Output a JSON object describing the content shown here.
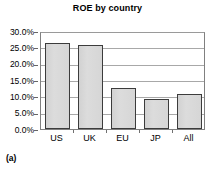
{
  "caption": "(a)",
  "chart_data": {
    "type": "bar",
    "title": "ROE by country",
    "xlabel": "",
    "ylabel": "",
    "categories": [
      "US",
      "UK",
      "EU",
      "JP",
      "All"
    ],
    "values": [
      26.3,
      25.8,
      12.7,
      9.3,
      10.8
    ],
    "ylim": [
      0,
      30
    ],
    "ytick_values": [
      0,
      5,
      10,
      15,
      20,
      25,
      30
    ],
    "ytick_labels": [
      "0.0%",
      "5.0%",
      "10.0%",
      "15.0%",
      "20.0%",
      "25.0%",
      "30.0%"
    ],
    "grid": true,
    "legend": false,
    "bar_fill_color": "#d8d8d8",
    "bar_border_color": "#3c3c3c",
    "gridline_color": "#a8a8a8",
    "axis_color": "#808080",
    "unit": "percent"
  }
}
